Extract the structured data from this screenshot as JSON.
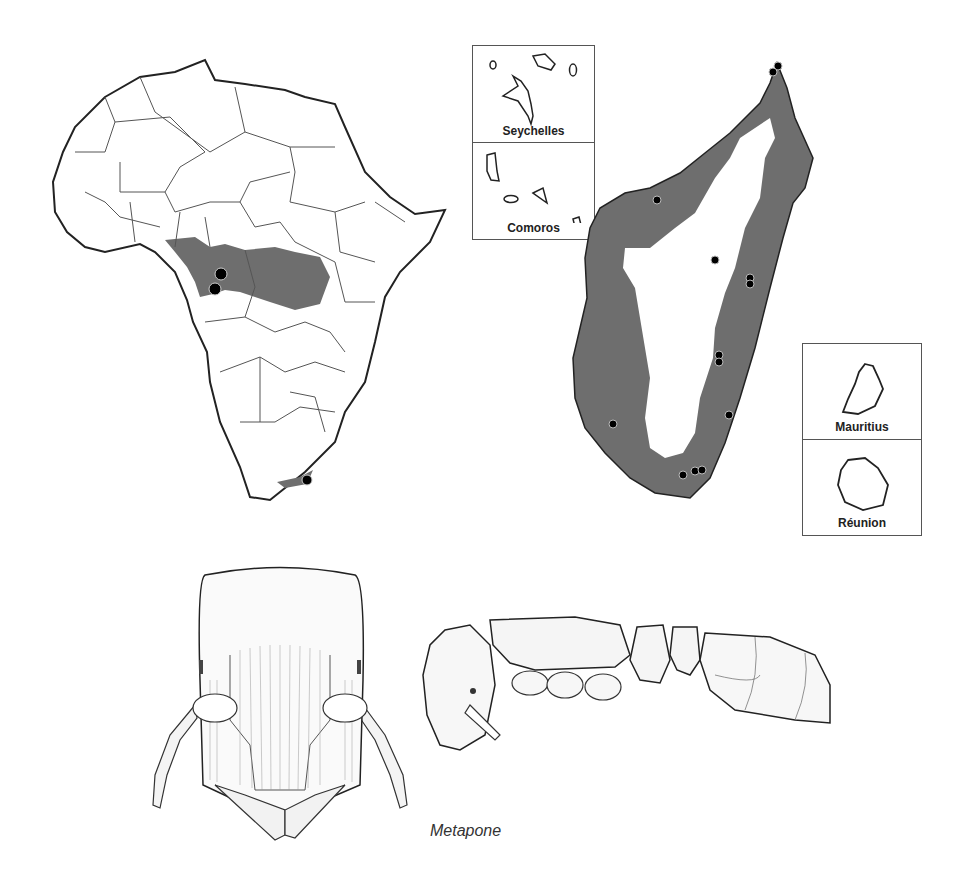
{
  "figure": {
    "caption": "Metapone",
    "colors": {
      "land_outline": "#222222",
      "border_line": "#555555",
      "range_fill": "#6e6e6e",
      "record_dot": "#000000",
      "background": "#ffffff"
    }
  },
  "maps": {
    "africa": {
      "label": "Africa distribution map",
      "record_count": 4
    },
    "madagascar": {
      "label": "Madagascar distribution map",
      "record_count": 15
    },
    "insets": [
      {
        "id": "seychelles",
        "label": "Seychelles"
      },
      {
        "id": "comoros",
        "label": "Comoros"
      },
      {
        "id": "mauritius",
        "label": "Mauritius"
      },
      {
        "id": "reunion",
        "label": "Réunion"
      }
    ]
  },
  "illustrations": {
    "head": {
      "label": "Head, full-face view"
    },
    "body": {
      "label": "Body, lateral view"
    }
  }
}
